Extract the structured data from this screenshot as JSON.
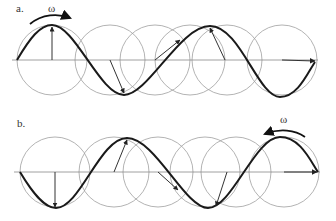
{
  "panels": [
    {
      "label": "a.",
      "omega_label": "ω",
      "rotation_direction": "clockwise",
      "axis_y": 60,
      "circle_centers_x": [
        52,
        110,
        145,
        190,
        227,
        282
      ],
      "circle_radius": 35
    },
    {
      "label": "b.",
      "omega_label": "ω",
      "rotation_direction": "counterclockwise",
      "axis_y": 172,
      "circle_centers_x": [
        55,
        112,
        150,
        208,
        245,
        282
      ],
      "circle_radius": 35
    }
  ],
  "colors": {
    "wave": "#1a1a1a",
    "circle": "#9a9a9a",
    "axis": "#888888",
    "arrow": "#333333"
  }
}
